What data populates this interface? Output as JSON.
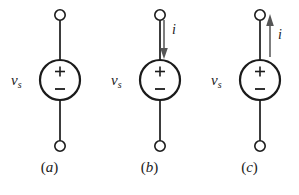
{
  "figure": {
    "background_color": "#ffffff",
    "stroke_color": "#1b1b1b",
    "panels": [
      {
        "id": "a",
        "caption_open_paren": "(",
        "caption_letter": "a",
        "caption_close_paren": ")",
        "source_label_symbol": "v",
        "source_label_subscript": "s",
        "polarity_plus": "+",
        "polarity_minus": "−",
        "current_arrow": null,
        "current_label": null
      },
      {
        "id": "b",
        "caption_open_paren": "(",
        "caption_letter": "b",
        "caption_close_paren": ")",
        "source_label_symbol": "v",
        "source_label_subscript": "s",
        "polarity_plus": "+",
        "polarity_minus": "−",
        "current_arrow": "down",
        "current_label": "i"
      },
      {
        "id": "c",
        "caption_open_paren": "(",
        "caption_letter": "c",
        "caption_close_paren": ")",
        "source_label_symbol": "v",
        "source_label_subscript": "s",
        "polarity_plus": "+",
        "polarity_minus": "−",
        "current_arrow": "up",
        "current_label": "i"
      }
    ]
  }
}
